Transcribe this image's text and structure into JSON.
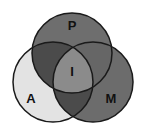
{
  "diagram": {
    "type": "venn-3",
    "sets": [
      {
        "id": "P",
        "label": "P",
        "cx": 72,
        "cy": 53,
        "r": 40
      },
      {
        "id": "A",
        "label": "A",
        "cx": 53,
        "cy": 82,
        "r": 40
      },
      {
        "id": "M",
        "label": "M",
        "cx": 93,
        "cy": 82,
        "r": 40
      }
    ],
    "center_label": "I",
    "colors": {
      "a_only": "#e3e3e3",
      "p_only": "#6e6e6e",
      "m_only": "#6c6c6c",
      "a_p": "#4b4b4b",
      "a_m": "#4b4b4b",
      "p_m": "#666666",
      "center": "#8b8b8b",
      "stroke": "#1a1a1a"
    }
  }
}
